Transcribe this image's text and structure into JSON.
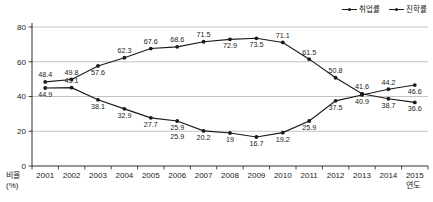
{
  "chart_data": {
    "type": "line",
    "title": "",
    "xlabel": "연도",
    "ylabel": "비율\n(%)",
    "ylabel_line1": "비율",
    "ylabel_line2": "(%)",
    "ylim": [
      0,
      80
    ],
    "yticks": [
      "0",
      "20",
      "40",
      "60",
      "80"
    ],
    "grid": true,
    "legend_position": "top-right",
    "categories": [
      "2001",
      "2002",
      "2003",
      "2004",
      "2005",
      "2006",
      "2007",
      "2008",
      "2009",
      "2010",
      "2011",
      "2012",
      "2013",
      "2014",
      "2015"
    ],
    "series": [
      {
        "name": "취업률",
        "color": "#1a1a1a",
        "values": [
          44.9,
          45.1,
          38.1,
          32.9,
          27.7,
          25.9,
          20.2,
          19,
          16.7,
          19.2,
          25.9,
          37.5,
          40.9,
          44.2,
          46.6
        ],
        "labels": [
          "44.9",
          "45.1",
          "38.1",
          "32.9",
          "27.7",
          "25.9",
          "20.2",
          "19",
          "16.7",
          "19.2",
          "25.9",
          "37.5",
          "40.9",
          "44.2",
          "46.6"
        ],
        "label_positions": [
          "below",
          "above",
          "below",
          "below",
          "below",
          "below",
          "below",
          "below",
          "below",
          "below",
          "below",
          "below",
          "below",
          "above",
          "below"
        ]
      },
      {
        "name": "진학률",
        "color": "#1a1a1a",
        "values": [
          48.4,
          49.8,
          57.6,
          62.3,
          67.6,
          68.6,
          71.5,
          72.9,
          73.5,
          71.1,
          61.5,
          50.8,
          41.6,
          38.7,
          36.6
        ],
        "labels": [
          "48.4",
          "49.8",
          "57.6",
          "62.3",
          "67.6",
          "68.6",
          "71.5",
          "72.9",
          "73.5",
          "71.1",
          "61.5",
          "50.8",
          "41.6",
          "38.7",
          "36.6"
        ],
        "label_positions": [
          "above",
          "above",
          "below",
          "above",
          "above",
          "above",
          "above",
          "below",
          "below",
          "above",
          "above",
          "above",
          "above",
          "below",
          "below"
        ]
      }
    ],
    "extra_labels": [
      {
        "text": "25.9",
        "series": "취업률",
        "category": "2006",
        "note": "duplicate label rendered below the 2006 point"
      }
    ]
  },
  "legend": {
    "items": [
      {
        "label": "취업률",
        "marker": "line-with-dot"
      },
      {
        "label": "진학률",
        "marker": "line-with-dot"
      }
    ]
  },
  "axes": {
    "y_caption_line1": "비율",
    "y_caption_line2": "(%)",
    "x_caption": "연도"
  }
}
